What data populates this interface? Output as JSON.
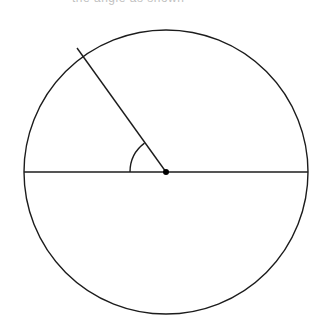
{
  "figure": {
    "name": "circle-with-central-angle",
    "background_color": "#ffffff",
    "stroke_color": "#1c1c1c",
    "point_color": "#000000",
    "canvas": {
      "width": 325,
      "height": 333
    },
    "clipped_header_text": "the angle as shown"
  },
  "chart_data": {
    "type": "diagram",
    "subtype": "geometric-circle-central-angle",
    "title": "",
    "xlabel": "",
    "ylabel": "",
    "grid": false,
    "legend": null,
    "units": "pixels",
    "elements": [
      {
        "id": "circle",
        "name": "circle-outline",
        "kind": "circle",
        "center": [
          166,
          172
        ],
        "radius": 142,
        "stroke": "#1c1c1c",
        "stroke_width": 1.4,
        "fill": "none"
      },
      {
        "id": "diameter",
        "name": "horizontal-diameter",
        "kind": "line",
        "from": [
          24,
          172
        ],
        "to": [
          308,
          172
        ],
        "stroke": "#1c1c1c",
        "stroke_width": 1.4
      },
      {
        "id": "radius",
        "name": "radius-segment",
        "kind": "line",
        "from": [
          166,
          172
        ],
        "to": [
          77,
          48
        ],
        "stroke": "#1c1c1c",
        "stroke_width": 1.4,
        "angle_degrees": 126.7
      },
      {
        "id": "angle-arc",
        "name": "central-angle-arc",
        "kind": "arc",
        "center": [
          166,
          172
        ],
        "radius": 36,
        "start_angle_degrees": 180,
        "end_angle_degrees": 126.7,
        "stroke": "#1c1c1c",
        "stroke_width": 1.4,
        "fill": "none"
      },
      {
        "id": "center-point",
        "name": "center-point-marker",
        "kind": "point",
        "position": [
          166,
          172
        ],
        "size": 6,
        "fill": "#000000"
      }
    ],
    "measurements": {
      "circle_diameter": 284,
      "circle_radius": 142,
      "central_angle_degrees": 126.7,
      "reflex_angle_degrees": 233.3,
      "arc_marker_radius": 36
    }
  }
}
